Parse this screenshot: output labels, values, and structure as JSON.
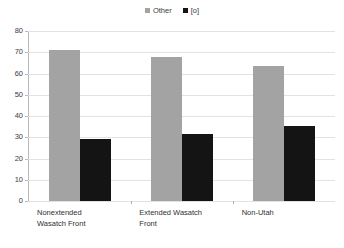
{
  "chart_data": {
    "type": "bar",
    "title": "",
    "subtitle": "",
    "xlabel": "",
    "ylabel": "",
    "ylim": [
      0,
      80
    ],
    "ytick_step": 10,
    "yticks": [
      "80",
      "70",
      "60",
      "50",
      "40",
      "30",
      "20",
      "10",
      "0"
    ],
    "grid": true,
    "legend_position": "top-center",
    "categories": [
      "Nonextended Wasatch Front",
      "Extended Wasatch Front",
      "Non-Utah"
    ],
    "series": [
      {
        "name": "Other",
        "color": "#a3a3a3",
        "values": [
          71,
          68,
          63.5
        ]
      },
      {
        "name": "[o]",
        "color": "#141414",
        "values": [
          29,
          31.5,
          35.5
        ]
      }
    ]
  },
  "legend": {
    "entries": [
      {
        "label": "Other",
        "swatch": "legend-swatch-other"
      },
      {
        "label": "[o]",
        "swatch": "legend-swatch-schwa"
      }
    ]
  },
  "axis": {
    "y": {
      "labels": [
        "80",
        "70",
        "60",
        "50",
        "40",
        "30",
        "20",
        "10",
        "0"
      ]
    },
    "x": {
      "labels": [
        "Nonextended Wasatch Front",
        "Extended Wasatch Front",
        "Non-Utah"
      ]
    }
  },
  "colors": {
    "series_other": "#a3a3a3",
    "series_schwa": "#141414",
    "gridline": "#e2e2e2",
    "axis": "#b8b8b8",
    "text": "#2f2f2f",
    "background": "#ffffff"
  }
}
